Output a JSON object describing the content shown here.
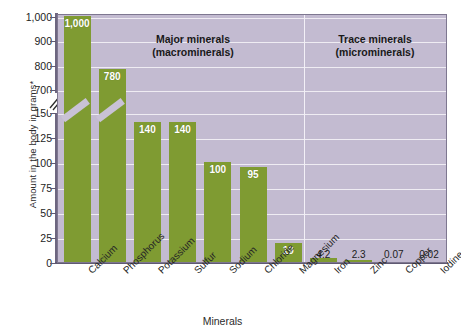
{
  "chart_data": {
    "type": "bar",
    "title": "",
    "xlabel": "Minerals",
    "ylabel": "Amount in the body in grams*",
    "categories": [
      "Calcium",
      "Phosphorus",
      "Potassium",
      "Sulfur",
      "Sodium",
      "Chloride",
      "Magnesium",
      "Iron",
      "Zinc",
      "Copper",
      "Iodine"
    ],
    "values": [
      1000,
      780,
      140,
      140,
      100,
      95,
      19,
      4.2,
      2.3,
      0.07,
      0.02
    ],
    "value_labels": [
      "1,000",
      "780",
      "140",
      "140",
      "100",
      "95",
      "19",
      "4.2",
      "2.3",
      "0.07",
      "0.02"
    ],
    "ylim": [
      0,
      1000
    ],
    "y_axis_broken": true,
    "y_break_between": [
      150,
      700
    ],
    "yticks_lower": [
      0,
      25,
      50,
      75,
      100,
      125,
      150
    ],
    "yticks_upper": [
      700,
      800,
      900,
      1000
    ],
    "ytick_labels": [
      "1,000",
      "900",
      "800",
      "700",
      "150",
      "125",
      "100",
      "75",
      "50",
      "25",
      "0"
    ],
    "grid": true,
    "legend": "none",
    "groups": [
      {
        "name": "Major minerals\n(macrominerals)",
        "members": [
          "Calcium",
          "Phosphorus",
          "Potassium",
          "Sulfur",
          "Sodium",
          "Chloride",
          "Magnesium"
        ]
      },
      {
        "name": "Trace minerals\n(microminerals)",
        "members": [
          "Iron",
          "Zinc",
          "Copper",
          "Iodine"
        ]
      }
    ],
    "colors": {
      "bar": "#7f9b32",
      "plot_background": "#c3bbd1",
      "gridline": "#efecf3",
      "axis": "#6d6680",
      "label_inside": "#ffffff",
      "label_outside": "#1b1b1b"
    }
  },
  "axes": {
    "y_title": "Amount in the body in grams*",
    "x_title": "Minerals",
    "ytick_labels": [
      "1,000",
      "900",
      "800",
      "700",
      "150",
      "125",
      "100",
      "75",
      "50",
      "25",
      "0"
    ]
  },
  "annotations": {
    "major_line1": "Major minerals",
    "major_line2": "(macrominerals)",
    "trace_line1": "Trace minerals",
    "trace_line2": "(microminerals)"
  }
}
